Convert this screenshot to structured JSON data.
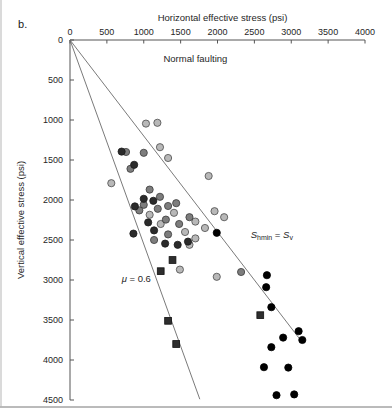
{
  "figure": {
    "panel_label": "b.",
    "background_color": "#ffffff",
    "frame_color": "#555555"
  },
  "chart_data": {
    "type": "scatter",
    "title": "",
    "xlabel": "Horizontal effective stress (psi)",
    "ylabel": "Vertical effective stress (psi)",
    "xlim": [
      0,
      4000
    ],
    "ylim": [
      4500,
      0
    ],
    "x_ticks": [
      0,
      500,
      1000,
      1500,
      2000,
      2500,
      3000,
      3500,
      4000
    ],
    "x_tick_labels": [
      "0",
      "500",
      "1000",
      "1500",
      "2000",
      "2500",
      "3000",
      "3500",
      "4000"
    ],
    "y_ticks": [
      0,
      500,
      1000,
      1500,
      2000,
      2500,
      3000,
      3500,
      4000,
      4500
    ],
    "y_tick_labels": [
      "0",
      "500",
      "1000",
      "1500",
      "2000",
      "2500",
      "3000",
      "3500",
      "4000",
      "4500"
    ],
    "x_axis_position": "top",
    "y_axis_inverted": true,
    "grid": false,
    "legend": "none",
    "annotations": [
      {
        "name": "regime-label",
        "text": "Normal faulting",
        "x": 1700,
        "y": 270
      },
      {
        "name": "shmin-sv-line-label",
        "text": "Shmin = Sv",
        "x": 2450,
        "y": 2480
      },
      {
        "name": "friction-coefficient-label",
        "text": "μ = 0.6",
        "x": 700,
        "y": 3020
      }
    ],
    "reference_lines": [
      {
        "name": "shmin-equals-sv",
        "label": "Shmin = Sv",
        "from": [
          0,
          0
        ],
        "to": [
          3150,
          3780
        ],
        "slope": 1.2,
        "color": "#6b6b6b"
      },
      {
        "name": "mu-0.6-frictional-limit",
        "label": "μ = 0.6",
        "from": [
          0,
          0
        ],
        "to": [
          1760,
          4490
        ],
        "slope": 2.55,
        "color": "#6b6b6b"
      }
    ],
    "series": [
      {
        "name": "light-gray-circles",
        "marker": "circle",
        "color": "#b8b8b8",
        "edge_color": "#4a4a4a",
        "points": [
          [
            1030,
            1045
          ],
          [
            1185,
            1035
          ],
          [
            1220,
            1340
          ],
          [
            1330,
            1475
          ],
          [
            560,
            1790
          ],
          [
            1880,
            1700
          ],
          [
            1960,
            2140
          ],
          [
            2090,
            2215
          ],
          [
            1700,
            2270
          ],
          [
            1830,
            2350
          ],
          [
            1560,
            2400
          ],
          [
            1700,
            2480
          ],
          [
            1620,
            2560
          ],
          [
            1230,
            2300
          ],
          [
            1080,
            2185
          ],
          [
            1410,
            2160
          ],
          [
            1990,
            2960
          ],
          [
            1490,
            2870
          ]
        ]
      },
      {
        "name": "medium-gray-circles",
        "marker": "circle",
        "color": "#7d7d7d",
        "edge_color": "#3a3a3a",
        "points": [
          [
            760,
            1400
          ],
          [
            1000,
            1410
          ],
          [
            820,
            1610
          ],
          [
            1080,
            1870
          ],
          [
            1220,
            1960
          ],
          [
            1000,
            2060
          ],
          [
            940,
            2130
          ],
          [
            1190,
            2110
          ],
          [
            1330,
            2075
          ],
          [
            1440,
            2040
          ],
          [
            1300,
            2245
          ],
          [
            1480,
            2300
          ],
          [
            1620,
            2215
          ],
          [
            1330,
            2430
          ],
          [
            1140,
            2500
          ],
          [
            2320,
            2900
          ]
        ]
      },
      {
        "name": "dark-circles",
        "marker": "circle",
        "color": "#2b2b2b",
        "edge_color": "#1a1a1a",
        "points": [
          [
            700,
            1395
          ],
          [
            870,
            1560
          ],
          [
            1000,
            1985
          ],
          [
            1130,
            2010
          ],
          [
            880,
            2080
          ],
          [
            1060,
            2280
          ],
          [
            860,
            2420
          ],
          [
            1140,
            2380
          ],
          [
            1290,
            2545
          ],
          [
            1460,
            2560
          ],
          [
            1600,
            2520
          ]
        ]
      },
      {
        "name": "black-circles",
        "marker": "circle",
        "color": "#000000",
        "edge_color": "#000000",
        "points": [
          [
            1990,
            2410
          ],
          [
            2670,
            2940
          ],
          [
            2660,
            3090
          ],
          [
            2730,
            3340
          ],
          [
            3100,
            3640
          ],
          [
            2890,
            3720
          ],
          [
            3150,
            3750
          ],
          [
            2730,
            3840
          ],
          [
            2630,
            4090
          ],
          [
            2960,
            4095
          ],
          [
            2800,
            4440
          ],
          [
            3040,
            4430
          ]
        ]
      },
      {
        "name": "dark-squares",
        "marker": "square",
        "color": "#2e2e2e",
        "edge_color": "#111111",
        "points": [
          [
            1390,
            2750
          ],
          [
            1230,
            2890
          ],
          [
            1330,
            3510
          ],
          [
            2580,
            3440
          ],
          [
            1440,
            3800
          ]
        ]
      }
    ]
  }
}
